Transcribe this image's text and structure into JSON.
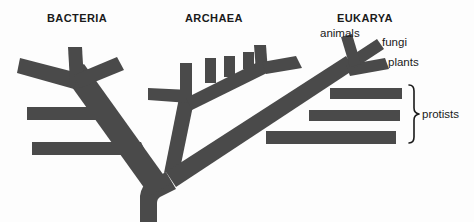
{
  "figure": {
    "type": "phylogenetic-tree",
    "background_color": "#fdfdfd",
    "branch_color": "#4a4a4a",
    "text_color": "#1a1a1a"
  },
  "domains": [
    {
      "id": "bacteria",
      "label": "BACTERIA"
    },
    {
      "id": "archaea",
      "label": "ARCHAEA"
    },
    {
      "id": "eukarya",
      "label": "EUKARYA"
    }
  ],
  "taxa": [
    {
      "id": "animals",
      "label": "animals"
    },
    {
      "id": "fungi",
      "label": "fungi"
    },
    {
      "id": "plants",
      "label": "plants"
    },
    {
      "id": "protists",
      "label": "protists"
    }
  ]
}
